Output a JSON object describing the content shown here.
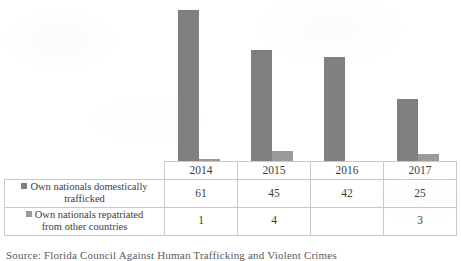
{
  "chart_data": {
    "type": "bar",
    "title": "",
    "xlabel": "",
    "ylabel": "",
    "categories": [
      "2014",
      "2015",
      "2016",
      "2017"
    ],
    "series": [
      {
        "name": "Own nationals domestically trafficked",
        "values": [
          61,
          45,
          42,
          25
        ],
        "color": "#808080"
      },
      {
        "name": "Own nationals repatriated from other countries",
        "values": [
          1,
          4,
          null,
          3
        ],
        "color": "#9a9a9a"
      }
    ],
    "ylim": [
      0,
      65
    ],
    "grid": false,
    "legend_position": "row-labels",
    "value_labels_shown_in": "table"
  },
  "table": {
    "corner": "",
    "year_headers": [
      "2014",
      "2015",
      "2016",
      "2017"
    ],
    "rows": [
      {
        "label_line1": "Own nationals domestically",
        "label_line2": "trafficked",
        "swatch_color": "#808080",
        "values": [
          "61",
          "45",
          "42",
          "25"
        ]
      },
      {
        "label_line1": "Own nationals repatriated",
        "label_line2": "from other countries",
        "swatch_color": "#9a9a9a",
        "values": [
          "1",
          "4",
          "",
          "3"
        ]
      }
    ]
  },
  "caption": {
    "text": "Source: Florida Council Against Human Trafficking and Violent Crimes"
  }
}
